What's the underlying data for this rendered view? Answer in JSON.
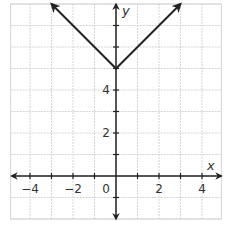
{
  "chart_data": {
    "type": "line",
    "title": "",
    "function": "y = |x| + 5",
    "xlabel": "x",
    "ylabel": "y",
    "xlim": [
      -4.9,
      4.9
    ],
    "ylim": [
      -2,
      8
    ],
    "grid": true,
    "x_ticks": [
      -4,
      -2,
      0,
      2,
      4
    ],
    "x_tick_labels": [
      "−4",
      "−2",
      "0",
      "2",
      "4"
    ],
    "y_ticks": [
      2,
      4
    ],
    "y_tick_labels": [
      "2",
      "4"
    ],
    "series": [
      {
        "name": "y = |x| + 5",
        "x": [
          -3,
          0,
          3
        ],
        "y": [
          8,
          5,
          8
        ],
        "arrows_at_ends": true
      }
    ],
    "vertex": [
      0,
      5
    ]
  },
  "colors": {
    "grid": "#d4d4d4",
    "axis": "#222222",
    "curve": "#222222"
  }
}
